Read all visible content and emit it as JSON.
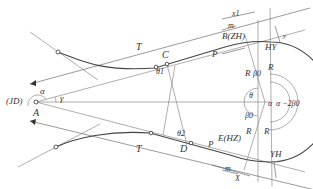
{
  "diagram": {
    "labels": {
      "vertex": "A",
      "vertex_code": "(JD)",
      "tangent_upper": "T",
      "tangent_lower": "T",
      "point_c": "C",
      "point_d": "D",
      "point_b": "B(ZH)",
      "point_e": "E(HZ)",
      "hy": "HY",
      "yh": "YH",
      "theta1": "θ1",
      "theta2": "θ2",
      "theta": "θ",
      "alpha_left": "α",
      "gamma": "γ",
      "alpha_center": "α",
      "alpha_minus": "α −2β0",
      "beta0_upper": "β0",
      "beta0_lower": "β0",
      "r_upper_left": "R",
      "r_upper_right": "R",
      "r_lower_left": "R",
      "r_lower_right": "R",
      "p_upper": "P",
      "p_lower": "P",
      "m_upper": "m",
      "m_lower": "m",
      "x_upper": "x1",
      "x_lower": "X",
      "y_upper": "y",
      "y_lower": "y"
    },
    "colors": {
      "line": "#777777",
      "curve": "#444444",
      "text": "#333333"
    }
  }
}
